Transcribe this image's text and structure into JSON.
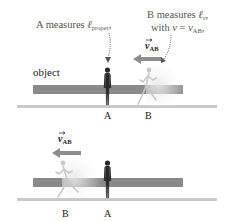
{
  "top_panel": {
    "annotation_a": {
      "prefix": "A measures ",
      "symbol": "ℓ",
      "subscript": "proper",
      "suffix": ","
    },
    "annotation_b": {
      "line1_prefix": "B measures ",
      "line1_symbol": "ℓ",
      "line1_subscript": "v",
      "line1_suffix": ",",
      "line2_prefix": "with ",
      "line2_var": "v",
      "line2_eq": " = ",
      "line2_var2": "v",
      "line2_subscript": "AB",
      "line2_suffix": ","
    },
    "velocity_label": {
      "symbol": "v",
      "subscript": "AB"
    },
    "object_label": "object",
    "person_a_label": "A",
    "person_b_label": "B"
  },
  "bottom_panel": {
    "velocity_label": {
      "symbol": "v",
      "subscript": "AB"
    },
    "person_a_label": "A",
    "person_b_label": "B"
  },
  "colors": {
    "object_bar": "#8a8a8a",
    "ground": "#c9c9c9",
    "arrow": "#8c8c8c",
    "person_a": "#2a2a2a",
    "person_b": "#c8c8c8"
  }
}
